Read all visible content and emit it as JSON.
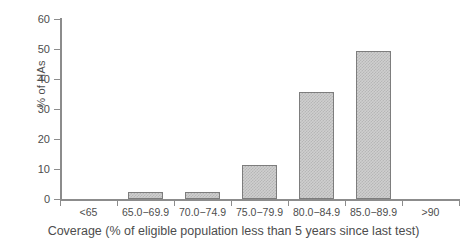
{
  "chart_data": {
    "type": "bar",
    "title": "",
    "xlabel": "Coverage (% of eligible population less than 5 years since last test)",
    "ylabel": "% of HAs",
    "categories": [
      "<65",
      "65.0−69.9",
      "70.0−74.9",
      "75.0−79.9",
      "80.0−84.9",
      "85.0−89.9",
      ">90"
    ],
    "values": [
      0,
      2.4,
      2.4,
      11.2,
      35.5,
      49.2,
      0
    ],
    "ylim": [
      0,
      60
    ],
    "yticks": [
      0,
      10,
      20,
      30,
      40,
      50,
      60
    ],
    "ytick_labels": [
      "0",
      "10",
      "20",
      "30",
      "40",
      "50",
      "60"
    ],
    "grid": false,
    "legend": false,
    "bar_fill_color": "#cfcfcf",
    "bar_edge_color": "#7d7d7d",
    "axis_color": "#8c8c8c",
    "text_color": "#4d4d4d"
  }
}
